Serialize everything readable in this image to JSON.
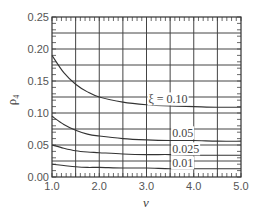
{
  "chart_data": {
    "type": "line",
    "title": "",
    "xlabel": "ν",
    "ylabel": "ρ₄",
    "xlim": [
      1.0,
      5.0
    ],
    "ylim": [
      0.0,
      0.25
    ],
    "grid": true,
    "x_ticks": [
      "1.0",
      "2.0",
      "3.0",
      "4.0",
      "5.0"
    ],
    "y_ticks": [
      "0.00",
      "0.05",
      "0.10",
      "0.15",
      "0.20",
      "0.25"
    ],
    "x": [
      1.0,
      1.25,
      1.5,
      1.75,
      2.0,
      2.5,
      3.0,
      3.5,
      4.0,
      4.5,
      5.0
    ],
    "series": [
      {
        "name": "ξ = 0.10",
        "label": "ξ = 0.10",
        "values": [
          0.19,
          0.163,
          0.145,
          0.133,
          0.125,
          0.117,
          0.113,
          0.111,
          0.11,
          0.109,
          0.109
        ]
      },
      {
        "name": "0.05",
        "label": "0.05",
        "values": [
          0.095,
          0.082,
          0.073,
          0.067,
          0.064,
          0.06,
          0.058,
          0.057,
          0.057,
          0.056,
          0.056
        ]
      },
      {
        "name": "0.025",
        "label": "0.025",
        "values": [
          0.05,
          0.045,
          0.041,
          0.039,
          0.038,
          0.036,
          0.035,
          0.035,
          0.034,
          0.034,
          0.034
        ]
      },
      {
        "name": "0.01",
        "label": "0.01",
        "values": [
          0.02,
          0.018,
          0.016,
          0.015,
          0.015,
          0.014,
          0.014,
          0.013,
          0.013,
          0.013,
          0.013
        ]
      }
    ],
    "annotations": [
      {
        "text": "ξ = 0.10",
        "x": 3.0,
        "y": 0.115
      },
      {
        "text": "0.05",
        "x": 3.5,
        "y": 0.062
      },
      {
        "text": "0.025",
        "x": 3.5,
        "y": 0.037
      },
      {
        "text": "0.01",
        "x": 3.5,
        "y": 0.015
      }
    ]
  }
}
